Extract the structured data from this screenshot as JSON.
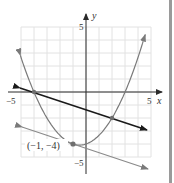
{
  "chart_data": {
    "type": "line",
    "title": "",
    "xlabel": "x",
    "ylabel": "y",
    "xlim": [
      -5,
      5
    ],
    "ylim": [
      -5,
      5
    ],
    "grid": true,
    "x_tick_labels": [
      "-5",
      "5"
    ],
    "y_tick_labels": [
      "5",
      "-5"
    ],
    "series": [
      {
        "name": "parabola",
        "equation": "y = x^2/3 + x/3 - 4",
        "color": "#7a7a7a",
        "x": [
          -5,
          -4,
          -3,
          -2,
          -1,
          -0.5,
          0,
          1,
          2,
          3,
          4,
          4.6
        ],
        "y": [
          2.67,
          0,
          -2,
          -3.33,
          -4,
          -4.08,
          -4,
          -3.33,
          -2,
          0,
          2.67,
          4.59
        ]
      },
      {
        "name": "secant line",
        "equation": "y = -x/3 - 4/3",
        "color": "#1a1a1a",
        "x": [
          -5,
          4.7
        ],
        "y": [
          0.33,
          -2.9
        ]
      },
      {
        "name": "tangent line",
        "equation": "y = -x/3 - 13/3",
        "color": "#8a8a8a",
        "x": [
          -5,
          4.8
        ],
        "y": [
          -2.67,
          -5.93
        ]
      }
    ],
    "points": [
      {
        "x": -4,
        "y": 0,
        "label": ""
      },
      {
        "x": 2,
        "y": -2,
        "label": ""
      },
      {
        "x": -1,
        "y": -4,
        "label": "(−1, −4)"
      }
    ],
    "annotations": [
      "(−1, −4)"
    ]
  },
  "labels": {
    "x_axis": "x",
    "y_axis": "y",
    "x_min_tick": "−5",
    "x_max_tick": "5",
    "y_max_tick": "5",
    "y_min_tick": "−5",
    "point_label": "(−1, −4)"
  },
  "colors": {
    "grid": "#e2e2e2",
    "axis": "#2a2a2a",
    "parabola": "#7a7a7a",
    "secant": "#1a1a1a",
    "tangent": "#8a8a8a",
    "point": "#6e6e6e",
    "border": "#9a9a9a"
  }
}
